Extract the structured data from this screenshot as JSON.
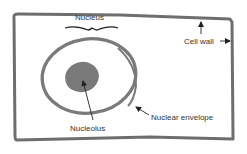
{
  "diagram": {
    "labels": {
      "nucleus": "Nucleus",
      "cell_wall": "Cell wall",
      "nuclear_envelope": "Nuclear envelope",
      "nucleolus": "Nucleolus"
    },
    "colors": {
      "outline": "#6e6e6e",
      "nucleolus_fill": "#7a7a7a",
      "text": "#333333",
      "arrow": "#222222",
      "background": "#ffffff"
    }
  }
}
